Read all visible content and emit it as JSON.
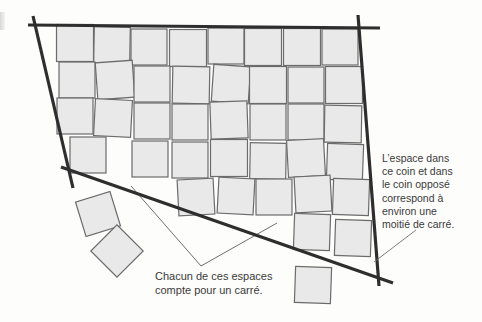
{
  "diagram": {
    "colors": {
      "background": "#fdfdfc",
      "square_fill": "#e9e9e9",
      "square_stroke": "#6b6b6b",
      "boundary": "#2e2e2e",
      "pointer": "#6f6f6f",
      "text": "#3a3a3a"
    },
    "boundary_lines": [
      {
        "name": "top-edge",
        "x1": 28,
        "y1": 25,
        "x2": 137,
        "y2": 25,
        "extra": {
          "x2": 380,
          "y2": 28
        }
      },
      {
        "name": "left-edge",
        "x1": 33,
        "y1": 16,
        "x2": 73,
        "y2": 188
      },
      {
        "name": "right-edge",
        "x1": 358,
        "y1": 15,
        "x2": 379,
        "y2": 286
      },
      {
        "name": "bottom-edge",
        "x1": 61,
        "y1": 167,
        "x2": 393,
        "y2": 283
      }
    ],
    "squares": [
      {
        "cx": 75,
        "cy": 43,
        "s": 37,
        "r": 0
      },
      {
        "cx": 112,
        "cy": 45,
        "s": 36,
        "r": 1
      },
      {
        "cx": 149,
        "cy": 47,
        "s": 36,
        "r": 0
      },
      {
        "cx": 188,
        "cy": 48,
        "s": 37,
        "r": 0
      },
      {
        "cx": 226,
        "cy": 46,
        "s": 36,
        "r": 0
      },
      {
        "cx": 263,
        "cy": 47,
        "s": 37,
        "r": 0
      },
      {
        "cx": 302,
        "cy": 47,
        "s": 37,
        "r": 0
      },
      {
        "cx": 340,
        "cy": 47,
        "s": 36,
        "r": 0
      },
      {
        "cx": 77,
        "cy": 80,
        "s": 36,
        "r": 0
      },
      {
        "cx": 115,
        "cy": 80,
        "s": 37,
        "r": -4
      },
      {
        "cx": 152,
        "cy": 84,
        "s": 36,
        "r": 0
      },
      {
        "cx": 191,
        "cy": 85,
        "s": 37,
        "r": 1
      },
      {
        "cx": 231,
        "cy": 84,
        "s": 37,
        "r": 4
      },
      {
        "cx": 268,
        "cy": 85,
        "s": 37,
        "r": 0
      },
      {
        "cx": 306,
        "cy": 85,
        "s": 36,
        "r": 0
      },
      {
        "cx": 344,
        "cy": 85,
        "s": 37,
        "r": 0
      },
      {
        "cx": 75,
        "cy": 116,
        "s": 36,
        "r": 0
      },
      {
        "cx": 113,
        "cy": 118,
        "s": 37,
        "r": 3
      },
      {
        "cx": 152,
        "cy": 121,
        "s": 36,
        "r": 0
      },
      {
        "cx": 190,
        "cy": 122,
        "s": 36,
        "r": 0
      },
      {
        "cx": 229,
        "cy": 120,
        "s": 37,
        "r": -2
      },
      {
        "cx": 268,
        "cy": 122,
        "s": 36,
        "r": 0
      },
      {
        "cx": 306,
        "cy": 122,
        "s": 36,
        "r": 0
      },
      {
        "cx": 343,
        "cy": 124,
        "s": 37,
        "r": 1
      },
      {
        "cx": 88,
        "cy": 155,
        "s": 36,
        "r": 0
      },
      {
        "cx": 150,
        "cy": 159,
        "s": 36,
        "r": 0
      },
      {
        "cx": 190,
        "cy": 160,
        "s": 36,
        "r": 0
      },
      {
        "cx": 229,
        "cy": 158,
        "s": 37,
        "r": 0
      },
      {
        "cx": 268,
        "cy": 161,
        "s": 36,
        "r": 1
      },
      {
        "cx": 306,
        "cy": 158,
        "s": 37,
        "r": -3
      },
      {
        "cx": 345,
        "cy": 162,
        "s": 36,
        "r": 2
      },
      {
        "cx": 196,
        "cy": 197,
        "s": 36,
        "r": -3
      },
      {
        "cx": 236,
        "cy": 196,
        "s": 36,
        "r": 3
      },
      {
        "cx": 274,
        "cy": 197,
        "s": 36,
        "r": 0
      },
      {
        "cx": 313,
        "cy": 194,
        "s": 36,
        "r": -3
      },
      {
        "cx": 351,
        "cy": 197,
        "s": 36,
        "r": 2
      },
      {
        "cx": 312,
        "cy": 232,
        "s": 36,
        "r": 2
      },
      {
        "cx": 353,
        "cy": 238,
        "s": 36,
        "r": 2
      },
      {
        "cx": 98,
        "cy": 214,
        "s": 36,
        "r": -17
      },
      {
        "cx": 117,
        "cy": 251,
        "s": 37,
        "r": 45
      },
      {
        "cx": 313,
        "cy": 285,
        "s": 36,
        "r": 2
      }
    ],
    "outline_shapes": [
      {
        "name": "triangle-gap-outline",
        "points": "131,186 201,266 277,223"
      }
    ],
    "pointers": [
      {
        "name": "pointer-to-corner",
        "x1": 416,
        "y1": 230,
        "x2": 374,
        "y2": 262
      }
    ],
    "captions": {
      "right": "L’espace dans\nce coin et dans\nle coin opposé\ncorrespond à\nenviron une\nmoitié de carré.",
      "bottom": "Chacun de ces espaces\ncompte pour un carré."
    }
  }
}
